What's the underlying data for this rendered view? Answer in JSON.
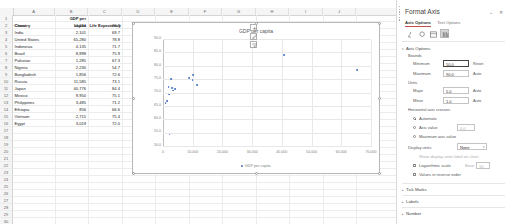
{
  "sheet": {
    "columns": [
      "A",
      "B",
      "C",
      "D",
      "E",
      "F",
      "G",
      "H",
      "I",
      "J"
    ],
    "headers": {
      "a": "Country",
      "b": "GDP per capita",
      "b_line1": "GDP per",
      "b_line2": "capita",
      "c": "Life Expectancy"
    },
    "rows": [
      {
        "n": "1",
        "country": "Country",
        "gdp": "capita",
        "life": "Life Expectancy"
      },
      {
        "n": "2",
        "country": "China",
        "gdp": "10,144",
        "life": "76.9"
      },
      {
        "n": "3",
        "country": "India",
        "gdp": "2,101",
        "life": "69.7"
      },
      {
        "n": "4",
        "country": "United States",
        "gdp": "65,280",
        "life": "78.8"
      },
      {
        "n": "5",
        "country": "Indonesia",
        "gdp": "4,135",
        "life": "71.7"
      },
      {
        "n": "6",
        "country": "Brazil",
        "gdp": "8,898",
        "life": "75.9"
      },
      {
        "n": "7",
        "country": "Pakistan",
        "gdp": "1,285",
        "life": "67.3"
      },
      {
        "n": "8",
        "country": "Nigeria",
        "gdp": "2,230",
        "life": "54.7"
      },
      {
        "n": "9",
        "country": "Bangladesh",
        "gdp": "1,856",
        "life": "72.6"
      },
      {
        "n": "10",
        "country": "Russia",
        "gdp": "11,585",
        "life": "73.1"
      },
      {
        "n": "11",
        "country": "Japan",
        "gdp": "40,776",
        "life": "84.4"
      },
      {
        "n": "12",
        "country": "Mexico",
        "gdp": "9,950",
        "life": "75.1"
      },
      {
        "n": "13",
        "country": "Philippines",
        "gdp": "3,485",
        "life": "71.2"
      },
      {
        "n": "14",
        "country": "Ethiopia",
        "gdp": "856",
        "life": "66.6"
      },
      {
        "n": "15",
        "country": "Vietnam",
        "gdp": "2,715",
        "life": "75.4"
      },
      {
        "n": "16",
        "country": "Egypt",
        "gdp": "3,019",
        "life": "72.0"
      },
      {
        "n": "17",
        "country": "",
        "gdp": "",
        "life": ""
      },
      {
        "n": "18",
        "country": "",
        "gdp": "",
        "life": ""
      },
      {
        "n": "19",
        "country": "",
        "gdp": "",
        "life": ""
      },
      {
        "n": "20",
        "country": "",
        "gdp": "",
        "life": ""
      },
      {
        "n": "21",
        "country": "",
        "gdp": "",
        "life": ""
      },
      {
        "n": "22",
        "country": "",
        "gdp": "",
        "life": ""
      },
      {
        "n": "23",
        "country": "",
        "gdp": "",
        "life": ""
      },
      {
        "n": "24",
        "country": "",
        "gdp": "",
        "life": ""
      },
      {
        "n": "25",
        "country": "",
        "gdp": "",
        "life": ""
      },
      {
        "n": "26",
        "country": "",
        "gdp": "",
        "life": ""
      },
      {
        "n": "27",
        "country": "",
        "gdp": "",
        "life": ""
      },
      {
        "n": "28",
        "country": "",
        "gdp": "",
        "life": ""
      },
      {
        "n": "29",
        "country": "",
        "gdp": "",
        "life": ""
      },
      {
        "n": "30",
        "country": "",
        "gdp": "",
        "life": ""
      },
      {
        "n": "31",
        "country": "",
        "gdp": "",
        "life": ""
      }
    ]
  },
  "chart_data": {
    "type": "scatter",
    "title": "GDP per capita",
    "xlabel": "",
    "ylabel": "",
    "xlim": [
      0,
      70000
    ],
    "ylim": [
      50.0,
      90.0
    ],
    "xticks": [
      "0",
      "10,000",
      "20,000",
      "30,000",
      "40,000",
      "50,000",
      "60,000",
      "70,000"
    ],
    "yticks": [
      "50.0",
      "55.0",
      "60.0",
      "65.0",
      "70.0",
      "75.0",
      "80.0",
      "85.0",
      "90.0"
    ],
    "grid": true,
    "legend": [
      "GDP per capita"
    ],
    "legend_position": "bottom",
    "marker_color": "#4472c4",
    "points": [
      {
        "label": "China",
        "x": 10144,
        "y": 76.9
      },
      {
        "label": "India",
        "x": 2101,
        "y": 69.7
      },
      {
        "label": "United States",
        "x": 65280,
        "y": 78.8
      },
      {
        "label": "Indonesia",
        "x": 4135,
        "y": 71.7
      },
      {
        "label": "Brazil",
        "x": 8898,
        "y": 75.9
      },
      {
        "label": "Pakistan",
        "x": 1285,
        "y": 67.3
      },
      {
        "label": "Nigeria",
        "x": 2230,
        "y": 54.7
      },
      {
        "label": "Bangladesh",
        "x": 1856,
        "y": 72.6
      },
      {
        "label": "Russia",
        "x": 11585,
        "y": 73.1
      },
      {
        "label": "Japan",
        "x": 40776,
        "y": 84.4
      },
      {
        "label": "Mexico",
        "x": 9950,
        "y": 75.1
      },
      {
        "label": "Philippines",
        "x": 3485,
        "y": 71.2
      },
      {
        "label": "Ethiopia",
        "x": 856,
        "y": 66.6
      },
      {
        "label": "Vietnam",
        "x": 2715,
        "y": 75.4
      },
      {
        "label": "Egypt",
        "x": 3019,
        "y": 72.0
      }
    ]
  },
  "chart_buttons": [
    {
      "name": "chart-elements",
      "glyph": "+"
    },
    {
      "name": "chart-styles",
      "glyph": "brush"
    },
    {
      "name": "chart-filters",
      "glyph": "funnel"
    }
  ],
  "pane": {
    "title": "Format Axis",
    "collapse_glyph": "⌄",
    "close_glyph": "✕",
    "tabs": [
      {
        "label": "Axis Options",
        "active": true
      },
      {
        "label": "Text Options",
        "active": false
      }
    ],
    "icons": [
      {
        "name": "fill-line-icon",
        "selected": false
      },
      {
        "name": "effects-icon",
        "selected": false
      },
      {
        "name": "size-properties-icon",
        "selected": false
      },
      {
        "name": "axis-options-icon",
        "selected": true
      }
    ],
    "sections": {
      "axis_options": "Axis Options",
      "bounds": "Bounds",
      "units": "Units",
      "horizontal_axis_crosses": "Horizontal axis crosses",
      "tick_marks": "Tick Marks",
      "labels": "Labels",
      "number": "Number"
    },
    "fields": {
      "minimum_label": "Minimum",
      "minimum_value": "50.0",
      "minimum_button": "Reset",
      "maximum_label": "Maximum",
      "maximum_value": "90.0",
      "maximum_button": "Auto",
      "major_label": "Major",
      "major_value": "5.0",
      "major_button": "Auto",
      "minor_label": "Minor",
      "minor_value": "1.0",
      "minor_button": "Auto"
    },
    "crosses": [
      {
        "label": "Automatic",
        "selected": true
      },
      {
        "label": "Axis value",
        "selected": false,
        "value": "0.0"
      },
      {
        "label": "Maximum axis value",
        "selected": false
      }
    ],
    "display_units": {
      "label": "Display units",
      "value": "None",
      "arrow": "▾"
    },
    "show_units_label": "Show display units label on chart",
    "log_scale": {
      "label": "Logarithmic scale",
      "base_label": "Base",
      "base_value": "10"
    },
    "reverse_order": "Values in reverse order"
  }
}
